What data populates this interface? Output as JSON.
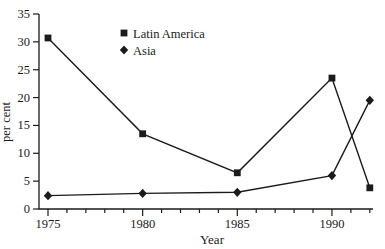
{
  "figure": {
    "background": "#ffffff",
    "ink_color": "#1b1b1b"
  },
  "chart_data": {
    "type": "line",
    "title": "",
    "xlabel": "Year",
    "ylabel": "per cent",
    "xlim": [
      1975,
      1992
    ],
    "ylim": [
      0,
      35
    ],
    "y_ticks": [
      0,
      5,
      10,
      15,
      20,
      25,
      30,
      35
    ],
    "x_major_ticks": [
      1975,
      1980,
      1985,
      1990
    ],
    "x_minor_tick_step": 1,
    "grid": false,
    "legend_position": "inside-top-center",
    "legend": [
      "Latin America",
      "Asia"
    ],
    "series": [
      {
        "name": "Latin America",
        "marker": "square",
        "x": [
          1975,
          1980,
          1985,
          1990,
          1992
        ],
        "values": [
          30.7,
          13.5,
          6.5,
          23.5,
          3.8
        ]
      },
      {
        "name": "Asia",
        "marker": "diamond",
        "x": [
          1975,
          1980,
          1985,
          1990,
          1992
        ],
        "values": [
          2.4,
          2.8,
          3.0,
          6.0,
          19.5
        ]
      }
    ]
  }
}
